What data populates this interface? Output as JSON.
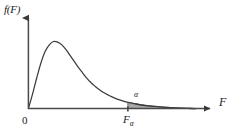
{
  "figure": {
    "kind": "f-distribution-density-plot",
    "background_color": "#ffffff",
    "curve_color": "#3c3c3c",
    "axis_color": "#4a4a4a",
    "shade_color": "#a8a8a8",
    "shade_edge_color": "#6a6a6a"
  },
  "axes": {
    "y_label": "f(F)",
    "x_label": "F",
    "origin_label": "0"
  },
  "annotations": {
    "critical_value_symbol": "F",
    "critical_value_subscript": "α",
    "tail_area_symbol": "α"
  },
  "chart_data": {
    "type": "area",
    "title": "",
    "subtitle": "",
    "xlabel": "F",
    "ylabel": "f(F)",
    "xlim": [
      0,
      10
    ],
    "ylim": [
      0,
      1
    ],
    "grid": false,
    "legend": null,
    "tick_labels": {
      "x": [
        "0",
        "Fα"
      ],
      "y": []
    },
    "series": [
      {
        "name": "F density curve",
        "x": [
          0.0,
          0.25,
          0.5,
          0.75,
          1.0,
          1.25,
          1.5,
          1.75,
          2.0,
          2.25,
          2.5,
          2.75,
          3.0,
          3.25,
          3.5,
          3.75,
          4.0,
          4.25,
          4.5,
          4.75,
          5.0,
          5.5,
          6.0,
          6.5,
          7.0,
          7.5,
          8.0,
          8.5,
          9.0,
          9.5,
          10.0
        ],
        "y": [
          0.0,
          0.22,
          0.46,
          0.68,
          0.85,
          0.95,
          1.0,
          0.99,
          0.95,
          0.88,
          0.79,
          0.7,
          0.61,
          0.53,
          0.45,
          0.385,
          0.33,
          0.28,
          0.24,
          0.205,
          0.175,
          0.125,
          0.09,
          0.065,
          0.046,
          0.032,
          0.022,
          0.014,
          0.008,
          0.003,
          0.0
        ]
      }
    ],
    "shaded_region": {
      "label": "α",
      "from_x": 5.95,
      "to_x": 10.0,
      "fill": "#a8a8a8",
      "description": "right tail area alpha beyond the critical value F-alpha"
    },
    "markers": [
      {
        "name": "critical-value",
        "x": 5.95,
        "label": "Fα",
        "axis": "x"
      }
    ]
  }
}
